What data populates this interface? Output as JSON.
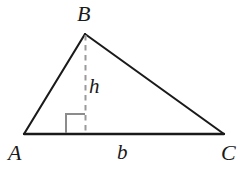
{
  "figure": {
    "kind": "geometry-diagram",
    "background_color": "#ffffff",
    "stroke_color": "#1a1a1a",
    "dash_color": "#999999",
    "right_angle_color": "#8c8c8c",
    "labels": {
      "apex": "B",
      "bottom_left": "A",
      "bottom_right": "C",
      "altitude": "h",
      "base": "b"
    },
    "geometry": {
      "vertex_A": [
        24,
        134
      ],
      "vertex_B": [
        85,
        34
      ],
      "vertex_C": [
        224,
        134
      ],
      "foot_of_altitude": [
        85,
        134
      ],
      "right_angle_marker": {
        "x": 66,
        "y": 114,
        "size": 19
      }
    }
  }
}
